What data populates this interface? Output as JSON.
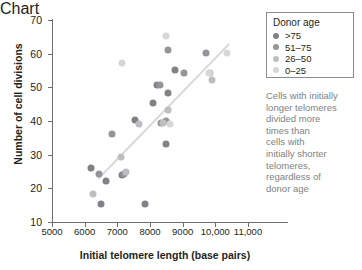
{
  "chart_data": {
    "type": "scatter",
    "title": "",
    "xlabel": "Initial telomere length (base pairs)",
    "ylabel": "Number of cell divisions",
    "xlim": [
      5000,
      11000
    ],
    "ylim": [
      10,
      70
    ],
    "xticks": [
      5000,
      6000,
      7000,
      8000,
      9000,
      10000,
      11000
    ],
    "xticklabels": [
      "5000",
      "6000",
      "7000",
      "8000",
      "9000",
      "10,000",
      "11,000"
    ],
    "yticks": [
      10,
      20,
      30,
      40,
      50,
      60,
      70
    ],
    "yticklabels": [
      "10",
      "20",
      "30",
      "40",
      "50",
      "60",
      "70"
    ],
    "grid": false,
    "legend_position": "top-right",
    "series": [
      {
        "name": ">75",
        "color": "#808285",
        "points": [
          {
            "x": 6200,
            "y": 26.1
          },
          {
            "x": 6500,
            "y": 15.2
          },
          {
            "x": 6650,
            "y": 22.2
          },
          {
            "x": 7150,
            "y": 24.1
          },
          {
            "x": 7550,
            "y": 40.2
          },
          {
            "x": 7850,
            "y": 15.2
          },
          {
            "x": 8100,
            "y": 45.2
          },
          {
            "x": 8200,
            "y": 50.7
          },
          {
            "x": 8500,
            "y": 33.3
          },
          {
            "x": 8550,
            "y": 48.2
          },
          {
            "x": 8750,
            "y": 55.2
          }
        ]
      },
      {
        "name": "51–75",
        "color": "#939598",
        "points": [
          {
            "x": 6450,
            "y": 24.3
          },
          {
            "x": 6850,
            "y": 36.2
          },
          {
            "x": 7200,
            "y": 24.2
          },
          {
            "x": 8300,
            "y": 50.8
          },
          {
            "x": 8350,
            "y": 39.3
          },
          {
            "x": 8500,
            "y": 39.9
          },
          {
            "x": 8550,
            "y": 61.2
          },
          {
            "x": 9050,
            "y": 54.3
          },
          {
            "x": 9700,
            "y": 60.2
          }
        ]
      },
      {
        "name": "26–50",
        "color": "#bcbec0",
        "points": [
          {
            "x": 6250,
            "y": 18.4
          },
          {
            "x": 7100,
            "y": 29.3
          },
          {
            "x": 7250,
            "y": 24.9
          },
          {
            "x": 7650,
            "y": 39.1
          },
          {
            "x": 8400,
            "y": 39.3
          },
          {
            "x": 8550,
            "y": 43.4
          },
          {
            "x": 9850,
            "y": 54.2
          },
          {
            "x": 9900,
            "y": 52.3
          }
        ]
      },
      {
        "name": "0–25",
        "color": "#d6d7d9",
        "points": [
          {
            "x": 7150,
            "y": 57.2
          },
          {
            "x": 8500,
            "y": 65.2
          },
          {
            "x": 8600,
            "y": 39.2
          },
          {
            "x": 9800,
            "y": 54.4
          },
          {
            "x": 10350,
            "y": 60.3
          }
        ]
      }
    ],
    "trendline": {
      "color": "#d9dadb",
      "x1": 6400,
      "y1": 23.0,
      "x2": 10400,
      "y2": 63.0
    }
  },
  "legend": {
    "title": "Donor age",
    "items": [
      {
        "label": ">75",
        "color": "#808285"
      },
      {
        "label": "51–75",
        "color": "#939598"
      },
      {
        "label": "26–50",
        "color": "#bcbec0"
      },
      {
        "label": "0–25",
        "color": "#d6d7d9"
      }
    ]
  },
  "annotation": {
    "lines": [
      "Cells with initially",
      "longer telomeres",
      "divided more",
      "times than",
      "cells with",
      "initially shorter",
      "telomeres,",
      "regardless of",
      "donor age"
    ]
  }
}
